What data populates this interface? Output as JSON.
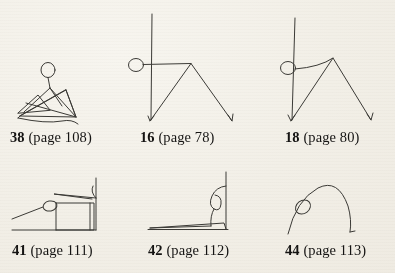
{
  "page": {
    "background_color": "#f4f1ea",
    "ink_color": "#3b3a36",
    "kind": "figure-plate"
  },
  "figures": [
    {
      "id": "figure-38",
      "number": "38",
      "page_ref": "(page 108)",
      "caption": "38 (page 108)",
      "description": "seated-crouching-stick-figure-with-crossing-lines",
      "head_circle": {
        "cx": 48,
        "cy": 70,
        "r": 7
      }
    },
    {
      "id": "figure-16",
      "number": "16",
      "page_ref": "(page 78)",
      "caption": "16 (page 78)",
      "description": "standing-stick-figure-straight-arm-vertical-back",
      "head_circle": {
        "cx": 136,
        "cy": 65,
        "r": 7
      }
    },
    {
      "id": "figure-18",
      "number": "18",
      "page_ref": "(page 80)",
      "caption": "18 (page 80)",
      "description": "standing-stick-figure-curved-arm-vertical-back",
      "head_circle": {
        "cx": 288,
        "cy": 68,
        "r": 7
      }
    },
    {
      "id": "figure-41",
      "number": "41",
      "page_ref": "(page 111)",
      "caption": "41 (page 111)",
      "description": "reclining-figure-horizontal-body-with-raised-back",
      "head_circle": {
        "cx": 50,
        "cy": 206,
        "r": 7
      }
    },
    {
      "id": "figure-42",
      "number": "42",
      "page_ref": "(page 112)",
      "caption": "42 (page 112)",
      "description": "upright-figure-vertical-line-with-hooked-head-and-baseline",
      "head_circle": {
        "cx": 216,
        "cy": 200,
        "r": 6
      }
    },
    {
      "id": "figure-44",
      "number": "44",
      "page_ref": "(page 113)",
      "caption": "44 (page 113)",
      "description": "arched-bridging-figure-with-head-on-left-flank",
      "head_circle": {
        "cx": 303,
        "cy": 206,
        "r": 7
      }
    }
  ],
  "captions": {
    "fig38": {
      "num": "38",
      "pg": " (page 108)"
    },
    "fig16": {
      "num": "16",
      "pg": " (page 78)"
    },
    "fig18": {
      "num": "18",
      "pg": " (page 80)"
    },
    "fig41": {
      "num": "41",
      "pg": " (page 111)"
    },
    "fig42": {
      "num": "42",
      "pg": " (page 112)"
    },
    "fig44": {
      "num": "44",
      "pg": " (page 113)"
    }
  }
}
